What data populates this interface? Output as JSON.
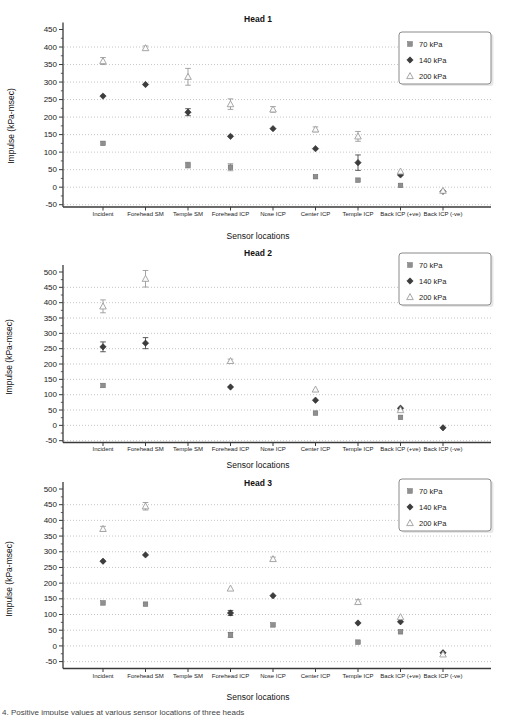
{
  "figure": {
    "caption": "4. Positive impulse values at various sensor locations of three heads"
  },
  "series_styles": [
    {
      "id": "s70",
      "label": "70 kPa",
      "marker": "square",
      "color": "#8f8f8f"
    },
    {
      "id": "s140",
      "label": "140 kPa",
      "marker": "diamond",
      "color": "#3d3d3d"
    },
    {
      "id": "s200",
      "label": "200 kPa",
      "marker": "triangle",
      "color": "#9e9e9e"
    }
  ],
  "chart_data": [
    {
      "type": "scatter",
      "title": "Head 1",
      "xlabel": "Sensor locations",
      "ylabel": "Impulse (kPa-msec)",
      "categories": [
        "Incident",
        "Forehead SM",
        "Temple SM",
        "Forehead ICP",
        "Nose ICP",
        "Center ICP",
        "Temple ICP",
        "Back ICP (+ve)",
        "Back ICP (-ve)"
      ],
      "ylim": [
        -50,
        450
      ],
      "ytick_step": 50,
      "grid": "dotted",
      "legend_position": "top-right",
      "legend_labels": [
        "70 kPa",
        "140 kPa",
        "200 kPa"
      ],
      "series": [
        {
          "name": "70 kPa",
          "points": [
            {
              "c": 0,
              "v": 125
            },
            {
              "c": 2,
              "v": 63,
              "e": 8
            },
            {
              "c": 3,
              "v": 57,
              "e": 10
            },
            {
              "c": 5,
              "v": 30
            },
            {
              "c": 6,
              "v": 20
            },
            {
              "c": 7,
              "v": 5
            }
          ]
        },
        {
          "name": "140 kPa",
          "points": [
            {
              "c": 0,
              "v": 260
            },
            {
              "c": 1,
              "v": 293
            },
            {
              "c": 2,
              "v": 214,
              "e": 10
            },
            {
              "c": 3,
              "v": 145
            },
            {
              "c": 4,
              "v": 167
            },
            {
              "c": 5,
              "v": 110
            },
            {
              "c": 6,
              "v": 70,
              "e": 22
            },
            {
              "c": 7,
              "v": 35
            },
            {
              "c": 8,
              "v": -12
            }
          ]
        },
        {
          "name": "200 kPa",
          "points": [
            {
              "c": 0,
              "v": 360,
              "e": 10
            },
            {
              "c": 1,
              "v": 397,
              "e": 6
            },
            {
              "c": 2,
              "v": 315,
              "e": 24
            },
            {
              "c": 3,
              "v": 237,
              "e": 15
            },
            {
              "c": 4,
              "v": 222,
              "e": 8
            },
            {
              "c": 5,
              "v": 165,
              "e": 7
            },
            {
              "c": 6,
              "v": 145,
              "e": 14
            },
            {
              "c": 7,
              "v": 45
            },
            {
              "c": 8,
              "v": -10
            }
          ]
        }
      ]
    },
    {
      "type": "scatter",
      "title": "Head 2",
      "xlabel": "Sensor locations",
      "ylabel": "Impulse (kPa-msec)",
      "categories": [
        "Incident",
        "Forehead SM",
        "Temple SM",
        "Forehead ICP",
        "Nose ICP",
        "Center ICP",
        "Temple ICP",
        "Back ICP (+ve)",
        "Back ICP (-ve)"
      ],
      "ylim": [
        -50,
        500
      ],
      "ytick_step": 50,
      "grid": "dotted",
      "legend_position": "top-right",
      "legend_labels": [
        "70 kPa",
        "140 kPa",
        "200 kPa"
      ],
      "series": [
        {
          "name": "70 kPa",
          "points": [
            {
              "c": 0,
              "v": 130
            },
            {
              "c": 5,
              "v": 40
            },
            {
              "c": 7,
              "v": 26
            }
          ]
        },
        {
          "name": "140 kPa",
          "points": [
            {
              "c": 0,
              "v": 256,
              "e": 16
            },
            {
              "c": 1,
              "v": 268,
              "e": 18
            },
            {
              "c": 3,
              "v": 125
            },
            {
              "c": 5,
              "v": 82
            },
            {
              "c": 7,
              "v": 56
            },
            {
              "c": 8,
              "v": -8
            }
          ]
        },
        {
          "name": "200 kPa",
          "points": [
            {
              "c": 0,
              "v": 388,
              "e": 21
            },
            {
              "c": 1,
              "v": 478,
              "e": 27
            },
            {
              "c": 3,
              "v": 210,
              "e": 6
            },
            {
              "c": 5,
              "v": 117
            },
            {
              "c": 7,
              "v": 50
            }
          ]
        }
      ]
    },
    {
      "type": "scatter",
      "title": "Head 3",
      "xlabel": "Sensor locations",
      "ylabel": "Impulse (kPa-msec)",
      "categories": [
        "Incident",
        "Forehead SM",
        "Temple SM",
        "Forehead ICP",
        "Nose ICP",
        "Center ICP",
        "Temple ICP",
        "Back ICP (+ve)",
        "Back ICP (-ve)"
      ],
      "ylim": [
        -50,
        500
      ],
      "ytick_step": 50,
      "grid": "dotted",
      "legend_position": "top-right",
      "legend_labels": [
        "70 kPa",
        "140 kPa",
        "200 kPa"
      ],
      "series": [
        {
          "name": "70 kPa",
          "points": [
            {
              "c": 0,
              "v": 137
            },
            {
              "c": 1,
              "v": 133
            },
            {
              "c": 3,
              "v": 35,
              "e": 8
            },
            {
              "c": 4,
              "v": 67
            },
            {
              "c": 6,
              "v": 12
            },
            {
              "c": 7,
              "v": 45
            }
          ]
        },
        {
          "name": "140 kPa",
          "points": [
            {
              "c": 0,
              "v": 270
            },
            {
              "c": 1,
              "v": 290
            },
            {
              "c": 3,
              "v": 105,
              "e": 8
            },
            {
              "c": 4,
              "v": 160
            },
            {
              "c": 6,
              "v": 73
            },
            {
              "c": 7,
              "v": 77
            },
            {
              "c": 8,
              "v": -22
            }
          ]
        },
        {
          "name": "200 kPa",
          "points": [
            {
              "c": 0,
              "v": 373,
              "e": 8
            },
            {
              "c": 1,
              "v": 445,
              "e": 12
            },
            {
              "c": 3,
              "v": 183
            },
            {
              "c": 4,
              "v": 277,
              "e": 6
            },
            {
              "c": 6,
              "v": 140,
              "e": 7
            },
            {
              "c": 7,
              "v": 92
            },
            {
              "c": 8,
              "v": -27
            }
          ]
        }
      ]
    }
  ]
}
